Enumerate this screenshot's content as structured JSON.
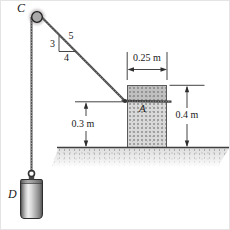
{
  "labels": {
    "pulley": "C",
    "block": "A",
    "weight": "D"
  },
  "dimensions": {
    "block_width": "0.25 m",
    "block_height": "0.4 m",
    "rope_height": "0.3 m"
  },
  "slope_triangle": {
    "rise": "3",
    "run": "4",
    "hypotenuse": "5"
  },
  "colors": {
    "rope": "#4a4a4a",
    "block_fill": "#d9d9d9",
    "ground_fill": "#dedede",
    "pulley_fill": "#a9a9a9",
    "line": "#2f2f2f",
    "background": "#ffffff"
  }
}
